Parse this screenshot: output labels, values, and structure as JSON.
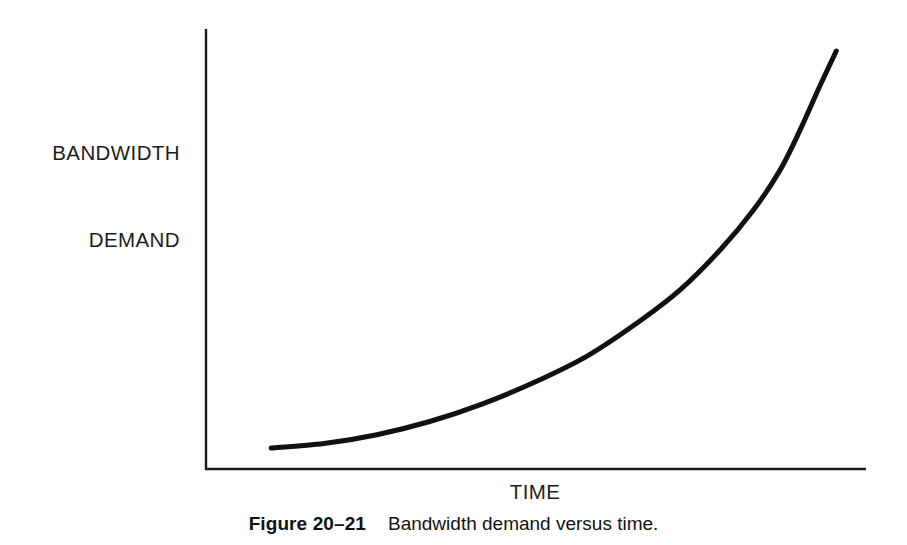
{
  "figure": {
    "caption_number": "Figure 20–21",
    "caption_text": "Bandwidth demand versus time.",
    "background_color": "#ffffff",
    "ink_color": "#1a1a1a"
  },
  "chart_data": {
    "type": "line",
    "title": "",
    "subtitle": "",
    "xlabel": "TIME",
    "ylabel": "BANDWIDTH DEMAND",
    "ylabel_lines": [
      "BANDWIDTH",
      "DEMAND"
    ],
    "grid": false,
    "legend": null,
    "legend_position": "none",
    "axis_ticks": false,
    "tick_labels_x": [],
    "tick_labels_y": [],
    "xlim": [
      0,
      1
    ],
    "ylim": [
      0,
      1
    ],
    "annotations": [],
    "series": [
      {
        "name": "Bandwidth demand",
        "color": "#111111",
        "line_width": 5,
        "description": "Exponential growth: nearly flat at first, then rising sharply to near-vertical at the right edge.",
        "x": [
          0.1,
          0.18,
          0.26,
          0.34,
          0.42,
          0.5,
          0.58,
          0.66,
          0.72,
          0.78,
          0.83,
          0.87,
          0.9,
          0.93,
          0.955
        ],
        "y": [
          0.05,
          0.06,
          0.08,
          0.11,
          0.15,
          0.2,
          0.26,
          0.34,
          0.41,
          0.5,
          0.59,
          0.68,
          0.77,
          0.87,
          0.95
        ]
      }
    ]
  },
  "axes": {
    "origin_x": 205,
    "origin_y": 470,
    "y_axis_top": 29,
    "x_axis_right": 866,
    "line_color": "#1a1a1a",
    "line_width": 2
  }
}
